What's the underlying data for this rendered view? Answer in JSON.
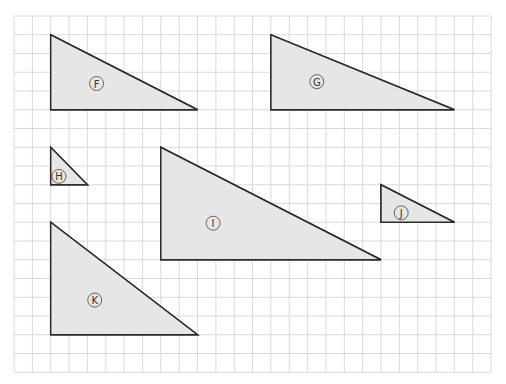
{
  "diagram": {
    "type": "triangles-on-grid",
    "grid": {
      "columns": 26,
      "rows": 19,
      "origin_px": [
        14,
        16
      ],
      "cell_px": [
        18.35,
        18.75
      ],
      "line_color": "#d6d6d6"
    },
    "colors": {
      "fill": "#e6e6e6",
      "stroke": "#2b2b2b",
      "background": "#ffffff"
    },
    "triangles": [
      {
        "label": "F",
        "points": [
          [
            2,
            1
          ],
          [
            2,
            5
          ],
          [
            10,
            5
          ]
        ],
        "base_cells": 8,
        "height_cells": 4,
        "label_pos": [
          4.5,
          3.6
        ]
      },
      {
        "label": "G",
        "points": [
          [
            14,
            1
          ],
          [
            14,
            5
          ],
          [
            24,
            5
          ]
        ],
        "base_cells": 10,
        "height_cells": 4,
        "label_pos": [
          16.5,
          3.5
        ]
      },
      {
        "label": "H",
        "points": [
          [
            2,
            7
          ],
          [
            2,
            9
          ],
          [
            4,
            9
          ]
        ],
        "base_cells": 2,
        "height_cells": 2,
        "label_pos": [
          2.45,
          8.55
        ]
      },
      {
        "label": "I",
        "points": [
          [
            8,
            7
          ],
          [
            8,
            13
          ],
          [
            20,
            13
          ]
        ],
        "base_cells": 12,
        "height_cells": 6,
        "label_pos": [
          10.85,
          11.05
        ]
      },
      {
        "label": "J",
        "points": [
          [
            20,
            9
          ],
          [
            20,
            11
          ],
          [
            24,
            11
          ]
        ],
        "base_cells": 4,
        "height_cells": 2,
        "label_pos": [
          21.1,
          10.5
        ]
      },
      {
        "label": "K",
        "points": [
          [
            2,
            11
          ],
          [
            2,
            17
          ],
          [
            10,
            17
          ]
        ],
        "base_cells": 8,
        "height_cells": 6,
        "label_pos": [
          4.4,
          15.15
        ]
      }
    ]
  }
}
